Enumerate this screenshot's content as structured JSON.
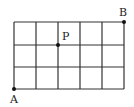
{
  "diagram": {
    "type": "grid",
    "columns": 5,
    "rows": 3,
    "line_color": "#333333",
    "points": [
      {
        "label": "A",
        "col": 0,
        "row": 3
      },
      {
        "label": "B",
        "col": 5,
        "row": 0
      },
      {
        "label": "P",
        "col": 2,
        "row": 1
      }
    ]
  },
  "labels": {
    "A": "A",
    "B": "B",
    "P": "P"
  }
}
